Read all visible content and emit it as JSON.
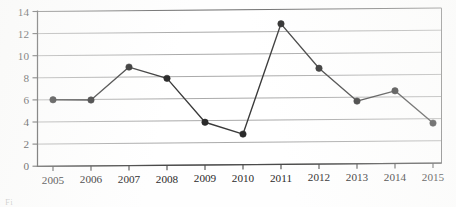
{
  "chart_data": {
    "type": "line",
    "title": "",
    "subtitle": "",
    "xlabel": "",
    "ylabel": "",
    "categories": [
      "2005",
      "2006",
      "2007",
      "2008",
      "2009",
      "2010",
      "2011",
      "2012",
      "2013",
      "2014",
      "2015"
    ],
    "values": [
      6.0,
      5.95,
      8.9,
      7.85,
      3.85,
      2.75,
      12.7,
      8.65,
      5.65,
      6.55,
      3.6
    ],
    "series": [
      {
        "name": "",
        "values": [
          6.0,
          5.95,
          8.9,
          7.85,
          3.85,
          2.75,
          12.7,
          8.65,
          5.65,
          6.55,
          3.6
        ]
      }
    ],
    "ylim": [
      0,
      14
    ],
    "yticks": [
      0,
      2,
      4,
      6,
      8,
      10,
      12,
      14
    ],
    "ytick_labels": [
      "0",
      "2",
      "4",
      "6",
      "8",
      "10",
      "12",
      "14"
    ],
    "xtick_labels": [
      "2005",
      "2006",
      "2007",
      "2008",
      "2009",
      "2010",
      "2011",
      "2012",
      "2013",
      "2014",
      "2015"
    ],
    "grid": "horizontal",
    "legend": "none",
    "marker": "filled-circle",
    "annotations": []
  },
  "style": {
    "line_color": "#3a3a3a",
    "marker_color": "#2a2a2a",
    "grid_color": "#9b9b9b",
    "axis_color": "#4a4a4a",
    "frame_color": "#6d6d6d",
    "background": "#fefefe",
    "text_color": "#2b2b2b"
  },
  "caption": {
    "clipped_text": "Fi"
  }
}
